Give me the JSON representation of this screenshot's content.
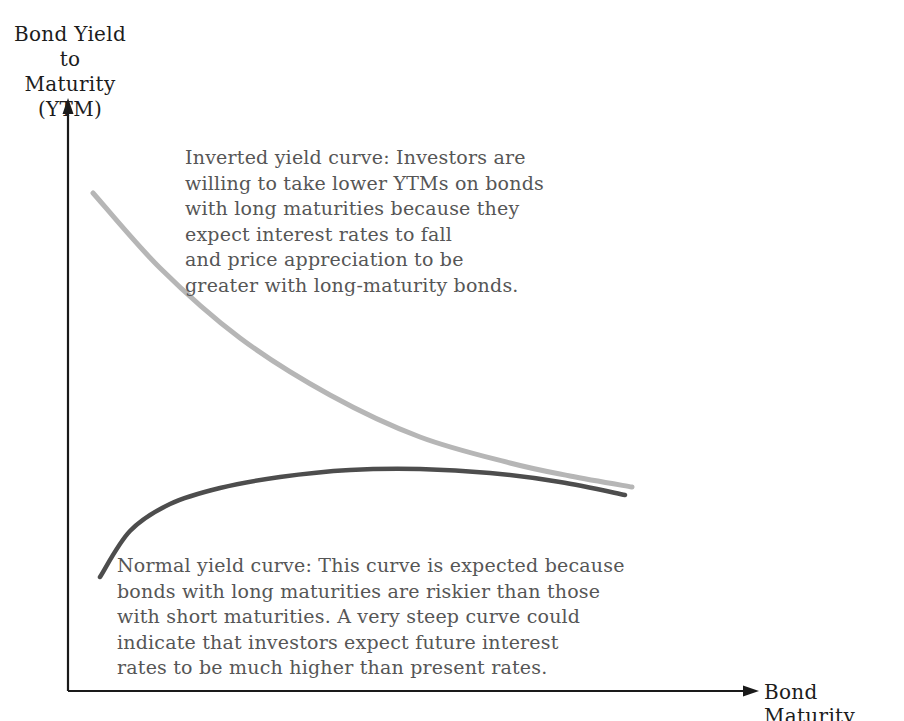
{
  "figure": {
    "background": "#ffffff",
    "axis_color": "#1a1a1a",
    "label_color": "#1c1c1c",
    "annotation_color": "#565656",
    "y_axis_label": {
      "lines": [
        "Bond Yield to",
        "Maturity",
        "(YTM)"
      ]
    },
    "x_axis_label": "Bond Maturity"
  },
  "chart_data": {
    "type": "line",
    "title": "",
    "xlabel": "Bond Maturity",
    "ylabel": "Bond Yield to Maturity (YTM)",
    "axes_numeric": false,
    "grid": false,
    "legend": "none (curves identified by in-chart annotations)",
    "plot_area_px": {
      "x_origin": 68,
      "y_origin": 691,
      "x_arrow_tip": 759,
      "y_arrow_tip": 100
    },
    "series": [
      {
        "name": "Inverted yield curve",
        "color": "#b6b6b6",
        "stroke_width": 5,
        "trend": "yield starts high at short maturities and declines steadily as maturity lengthens",
        "points_px": [
          [
            93,
            193
          ],
          [
            160,
            268
          ],
          [
            240,
            338
          ],
          [
            330,
            395
          ],
          [
            420,
            437
          ],
          [
            510,
            463
          ],
          [
            570,
            476
          ],
          [
            632,
            487
          ]
        ]
      },
      {
        "name": "Normal yield curve",
        "color": "#4d4d4d",
        "stroke_width": 4.5,
        "trend": "yield rises steeply at short maturities, peaks, then flattens and dips slightly at long maturities",
        "points_px": [
          [
            100,
            577
          ],
          [
            130,
            531
          ],
          [
            170,
            504
          ],
          [
            220,
            488
          ],
          [
            280,
            477
          ],
          [
            350,
            470
          ],
          [
            420,
            469
          ],
          [
            490,
            473
          ],
          [
            560,
            482
          ],
          [
            625,
            495
          ]
        ]
      }
    ],
    "annotations": [
      {
        "series": "Inverted yield curve",
        "lines": [
          "Inverted yield curve: Investors are",
          "willing to take lower YTMs on bonds",
          "with long maturities because they",
          "expect interest rates to fall",
          "and price appreciation to be",
          "greater with long-maturity bonds."
        ]
      },
      {
        "series": "Normal yield curve",
        "lines": [
          "Normal yield curve: This curve is expected because",
          "bonds with long maturities are riskier than those",
          "with short maturities. A very steep curve could",
          "indicate that investors expect future interest",
          "rates to be much higher than present rates."
        ]
      }
    ]
  }
}
